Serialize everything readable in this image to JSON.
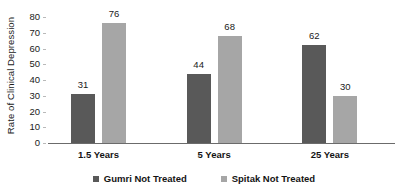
{
  "chart_data": {
    "type": "bar",
    "title": "",
    "subtitle": "",
    "xlabel": "",
    "ylabel": "Rate of Clinical Depression",
    "categories": [
      "1.5 Years",
      "5 Years",
      "25 Years"
    ],
    "series": [
      {
        "name": "Gumri Not Treated",
        "color": "#595959",
        "values": [
          31,
          44,
          62
        ],
        "value_labels": [
          "31",
          "44",
          "62"
        ]
      },
      {
        "name": "Spitak Not Treated",
        "color": "#a6a6a6",
        "values": [
          76,
          68,
          30
        ],
        "value_labels": [
          "76",
          "68",
          "30"
        ]
      }
    ],
    "ylim": [
      0,
      80
    ],
    "ytick_values": [
      0,
      10,
      20,
      30,
      40,
      50,
      60,
      70,
      80
    ],
    "ytick_labels": [
      "0",
      "10",
      "20",
      "30",
      "40",
      "50",
      "60",
      "70",
      "80"
    ],
    "grid": false,
    "legend_position": "bottom",
    "annotations": [],
    "axis_color": "#6b6b6b",
    "background": "#ffffff"
  },
  "legend": {
    "items": [
      {
        "label": "Gumri Not Treated",
        "color": "#595959",
        "swatch_name": "legend-swatch-gumri"
      },
      {
        "label": "Spitak Not Treated",
        "color": "#a6a6a6",
        "swatch_name": "legend-swatch-spitak"
      }
    ]
  }
}
